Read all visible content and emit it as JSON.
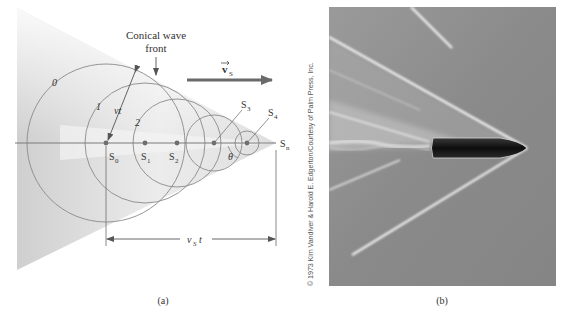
{
  "figure": {
    "panel_a": {
      "caption": "(a)",
      "annotation": {
        "line1": "Conical wave",
        "line2": "front"
      },
      "velocity_label": "v",
      "velocity_subscript": "S",
      "circle_labels": [
        "0",
        "1",
        "2"
      ],
      "radius_label": "vt",
      "source_labels": [
        {
          "main": "S",
          "sub": "0"
        },
        {
          "main": "S",
          "sub": "1"
        },
        {
          "main": "S",
          "sub": "2"
        },
        {
          "main": "S",
          "sub": "3"
        },
        {
          "main": "S",
          "sub": "4"
        },
        {
          "main": "S",
          "sub": "n"
        }
      ],
      "angle_label": "θ",
      "distance_label": {
        "main": "v",
        "sub": "S",
        "tail": "t"
      }
    },
    "panel_b": {
      "caption": "(b)",
      "credit": "© 1973 Kim Vandiver & Harold E. Edgerton/Courtesy of Palm Press, Inc."
    }
  },
  "colors": {
    "line": "#7a7a7a",
    "dot": "#6e6e6e",
    "cone": "#d9d9d9",
    "photo_bg": "#8c8c8c",
    "bullet": "#1a1a1a"
  }
}
